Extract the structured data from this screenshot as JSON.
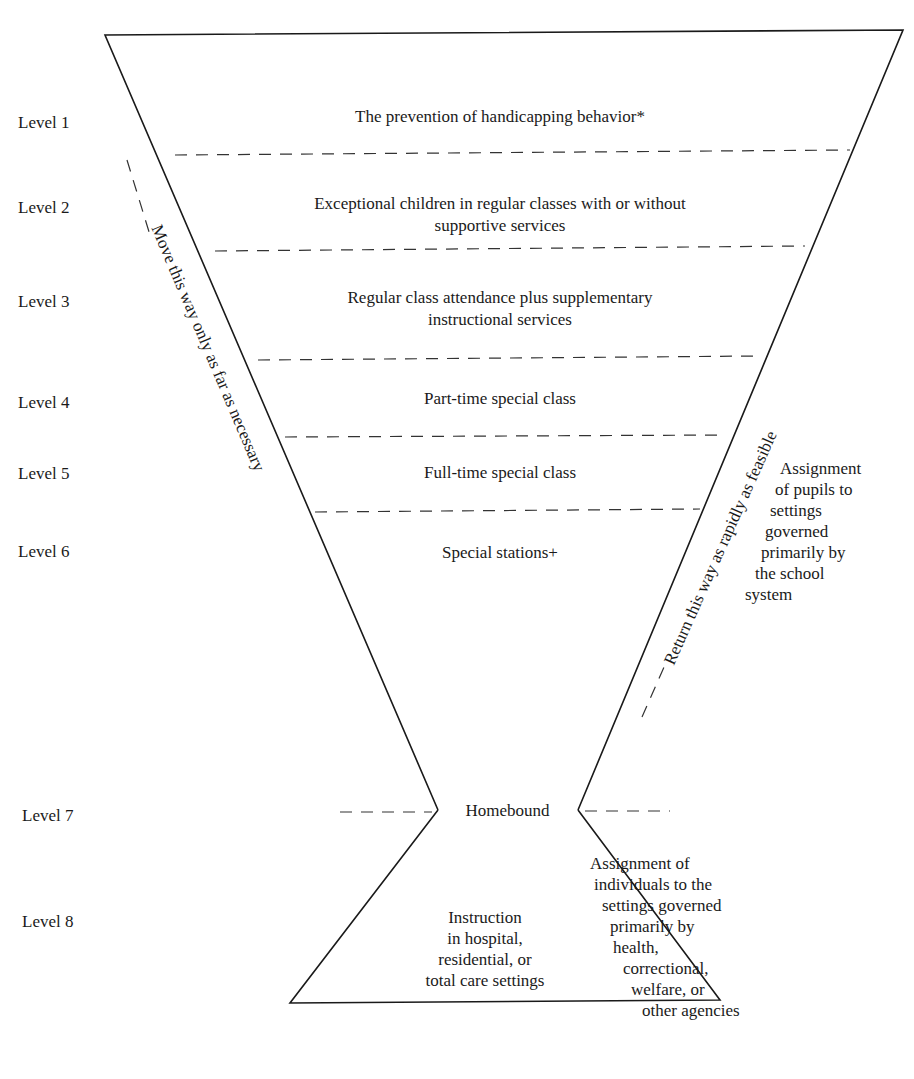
{
  "levels": [
    {
      "label": "Level 1",
      "text": "The prevention of handicapping behavior*"
    },
    {
      "label": "Level 2",
      "text_line1": "Exceptional children in regular classes with or without",
      "text_line2": "supportive services"
    },
    {
      "label": "Level 3",
      "text_line1": "Regular class attendance plus supplementary",
      "text_line2": "instructional services"
    },
    {
      "label": "Level 4",
      "text": "Part-time special class"
    },
    {
      "label": "Level 5",
      "text": "Full-time special class"
    },
    {
      "label": "Level 6",
      "text": "Special stations+"
    },
    {
      "label": "Level 7",
      "text": "Homebound"
    },
    {
      "label": "Level 8",
      "lines": [
        "Instruction",
        "in hospital,",
        "residential, or",
        "total care settings"
      ]
    }
  ],
  "arrows": {
    "left": "Move this way only as far as necessary",
    "right": "Return this way as rapidly as feasible"
  },
  "notes": {
    "school": [
      "Assignment",
      "of pupils to",
      "settings",
      "governed",
      "primarily by",
      "the school",
      "system"
    ],
    "agencies": [
      "Assignment of",
      "individuals to the",
      "settings governed",
      "primarily by",
      "health,",
      "correctional,",
      "welfare, or",
      "other agencies"
    ]
  }
}
